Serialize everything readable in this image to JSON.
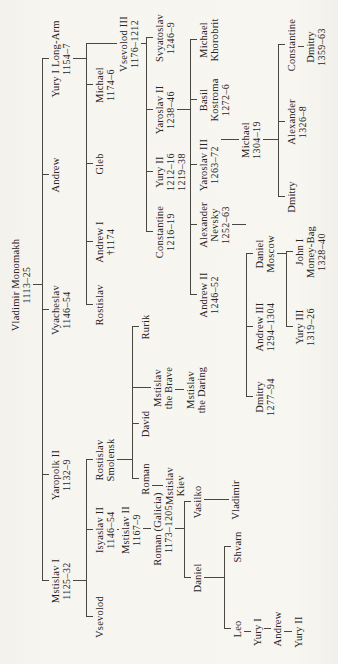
{
  "page": {
    "background": "#f6f4ef",
    "ink": "#26241f",
    "line_color": "#4a4641"
  },
  "tree": {
    "line_height": 11,
    "nodes": [
      {
        "id": "monomakh",
        "name": [
          "Vladimir Monomakh"
        ],
        "dates": [
          "1113–25"
        ],
        "x": 379,
        "y": 10,
        "children": [
          "mstislav1",
          "yaropolk2",
          "vyacheslav",
          "andrew_mono",
          "yury1long"
        ]
      },
      {
        "id": "mstislav1",
        "name": [
          "Mstislav I"
        ],
        "dates": [
          "1125–32"
        ],
        "x": 83,
        "y": 50,
        "children": [
          "vsevolod",
          "isyaslav2",
          "rost_smol"
        ]
      },
      {
        "id": "yaropolk2",
        "name": [
          "Yaropolk II"
        ],
        "dates": [
          "1132–9"
        ],
        "x": 189,
        "y": 50,
        "children": []
      },
      {
        "id": "vyacheslav",
        "name": [
          "Vyacheslav"
        ],
        "dates": [
          "1146–54"
        ],
        "x": 354,
        "y": 50,
        "children": []
      },
      {
        "id": "andrew_mono",
        "name": [
          "Andrew"
        ],
        "dates": [],
        "x": 489,
        "y": 50,
        "children": []
      },
      {
        "id": "yury1long",
        "name": [
          "Yury I Long-Arm"
        ],
        "dates": [
          "1154–7"
        ],
        "x": 605,
        "y": 50,
        "children": [
          "rostislav_y",
          "andrew1",
          "gleb",
          "michael_1174",
          "vsevolod3"
        ]
      },
      {
        "id": "vsevolod",
        "name": [
          "Vsevolod"
        ],
        "dates": [],
        "x": 47,
        "y": 94,
        "children": []
      },
      {
        "id": "isyaslav2",
        "name": [
          "Isyaslav II"
        ],
        "dates": [
          "1146–54"
        ],
        "x": 134,
        "y": 94,
        "children": [
          "mstislav2"
        ]
      },
      {
        "id": "rost_smol",
        "name": [
          "Rostislav",
          "Smolensk"
        ],
        "dates": [],
        "x": 204,
        "y": 94,
        "children": [
          "roman_s",
          "david",
          "mst_brave",
          "rurik"
        ]
      },
      {
        "id": "rostislav_y",
        "name": [
          "Rostislav"
        ],
        "dates": [],
        "x": 359,
        "y": 94,
        "children": []
      },
      {
        "id": "andrew1",
        "name": [
          "Andrew I"
        ],
        "dates": [
          "†1174"
        ],
        "x": 422,
        "y": 94,
        "children": []
      },
      {
        "id": "gleb",
        "name": [
          "Gleb"
        ],
        "dates": [],
        "x": 500,
        "y": 94,
        "children": []
      },
      {
        "id": "michael_1174",
        "name": [
          "Michael"
        ],
        "dates": [
          "1174–6"
        ],
        "x": 579,
        "y": 94,
        "children": []
      },
      {
        "id": "vsevolod3",
        "name": [
          "Vsevolod III"
        ],
        "dates": [
          "1176–1212"
        ],
        "x": 620,
        "y": 118,
        "children": [
          "constantine_1216",
          "yury2",
          "yaroslav2",
          "svyatoslav"
        ]
      },
      {
        "id": "mstislav2",
        "name": [
          "Mstislav II"
        ],
        "dates": [
          "1167–9"
        ],
        "x": 134,
        "y": 120,
        "children": [
          "roman_gal"
        ]
      },
      {
        "id": "roman_gal",
        "name": [
          "Roman (Galicia)"
        ],
        "dates": [
          "1173–1205"
        ],
        "x": 135,
        "y": 152,
        "children": [
          "daniel_gal",
          "vasilko"
        ]
      },
      {
        "id": "roman_s",
        "name": [
          "Roman"
        ],
        "dates": [],
        "x": 185,
        "y": 140,
        "children": [
          "mst_kiev"
        ]
      },
      {
        "id": "david",
        "name": [
          "David"
        ],
        "dates": [],
        "x": 240,
        "y": 140,
        "children": []
      },
      {
        "id": "mst_brave",
        "name": [
          "Mstislav",
          "the Brave"
        ],
        "dates": [],
        "x": 276,
        "y": 152,
        "children": [
          "mst_daring"
        ]
      },
      {
        "id": "rurik",
        "name": [
          "Rurik"
        ],
        "dates": [],
        "x": 337,
        "y": 140,
        "children": []
      },
      {
        "id": "mst_kiev",
        "name": [
          "Mstislav",
          "Kiev"
        ],
        "dates": [],
        "x": 178,
        "y": 164,
        "children": []
      },
      {
        "id": "mst_daring",
        "name": [
          "Mstislav",
          "the Daring"
        ],
        "dates": [],
        "x": 274,
        "y": 185,
        "children": []
      },
      {
        "id": "constantine_1216",
        "name": [
          "Constantine"
        ],
        "dates": [
          "1216–19"
        ],
        "x": 432,
        "y": 154,
        "children": []
      },
      {
        "id": "yury2",
        "name": [
          "Yury II"
        ],
        "dates": [
          "1212–16",
          "1219–38"
        ],
        "x": 492,
        "y": 154,
        "children": []
      },
      {
        "id": "yaroslav2",
        "name": [
          "Yaroslav II"
        ],
        "dates": [
          "1238–46"
        ],
        "x": 554,
        "y": 154,
        "children": [
          "andrew2",
          "nevsky",
          "yaroslav3",
          "basil",
          "mikh_khor"
        ]
      },
      {
        "id": "svyatoslav",
        "name": [
          "Svyatoslav"
        ],
        "dates": [
          "1246–9"
        ],
        "x": 626,
        "y": 154,
        "children": []
      },
      {
        "id": "daniel_gal",
        "name": [
          "Daniel"
        ],
        "dates": [],
        "x": 86,
        "y": 192,
        "children": [
          "leo",
          "shvarn"
        ]
      },
      {
        "id": "vasilko",
        "name": [
          "Vasilko"
        ],
        "dates": [],
        "x": 162,
        "y": 192,
        "children": [
          "vladimir"
        ]
      },
      {
        "id": "vladimir",
        "name": [
          "Vladimir"
        ],
        "dates": [],
        "x": 164,
        "y": 230,
        "children": []
      },
      {
        "id": "shvarn",
        "name": [
          "Shvarn"
        ],
        "dates": [],
        "x": 117,
        "y": 232,
        "children": []
      },
      {
        "id": "leo",
        "name": [
          "Leo"
        ],
        "dates": [],
        "x": 35,
        "y": 232,
        "children": [
          "yury1_gal"
        ]
      },
      {
        "id": "yury1_gal",
        "name": [
          "Yury I"
        ],
        "dates": [],
        "x": 32,
        "y": 252,
        "children": [
          "andrew_gal"
        ]
      },
      {
        "id": "andrew_gal",
        "name": [
          "Andrew"
        ],
        "dates": [],
        "x": 35,
        "y": 272,
        "children": [
          "yury2_gal"
        ]
      },
      {
        "id": "yury2_gal",
        "name": [
          "Yury II"
        ],
        "dates": [],
        "x": 32,
        "y": 293,
        "children": []
      },
      {
        "id": "andrew2",
        "name": [
          "Andrew II"
        ],
        "dates": [
          "1246–52"
        ],
        "x": 369,
        "y": 198,
        "children": []
      },
      {
        "id": "nevsky",
        "name": [
          "Alexander",
          "Nevsky"
        ],
        "dates": [
          "1252–63"
        ],
        "x": 439,
        "y": 198,
        "children": [
          "dmitry_1277",
          "andrew3",
          "daniel_mosc"
        ]
      },
      {
        "id": "yaroslav3",
        "name": [
          "Yaroslav III"
        ],
        "dates": [
          "1263–72"
        ],
        "x": 499,
        "y": 198,
        "children": [
          "michael_1304"
        ]
      },
      {
        "id": "basil",
        "name": [
          "Basil",
          "Kostroma"
        ],
        "dates": [
          "1272–6"
        ],
        "x": 564,
        "y": 198,
        "children": []
      },
      {
        "id": "mikh_khor",
        "name": [
          "Michael",
          "Khorobrit"
        ],
        "dates": [],
        "x": 624,
        "y": 198,
        "children": []
      },
      {
        "id": "michael_1304",
        "name": [
          "Michael"
        ],
        "dates": [
          "1304–19"
        ],
        "x": 524,
        "y": 240,
        "children": [
          "dmitry_tver",
          "alexander_1326",
          "constantine_tver"
        ]
      },
      {
        "id": "dmitry_1277",
        "name": [
          "Dmitry"
        ],
        "dates": [
          "1277–94"
        ],
        "x": 267,
        "y": 254,
        "children": []
      },
      {
        "id": "andrew3",
        "name": [
          "Andrew III"
        ],
        "dates": [
          "1294–1304"
        ],
        "x": 337,
        "y": 254,
        "children": []
      },
      {
        "id": "daniel_mosc",
        "name": [
          "Daniel",
          "Moscow"
        ],
        "dates": [],
        "x": 410,
        "y": 254,
        "children": [
          "yury3",
          "john1"
        ]
      },
      {
        "id": "yury3",
        "name": [
          "Yury III"
        ],
        "dates": [
          "1319–26"
        ],
        "x": 337,
        "y": 294,
        "children": []
      },
      {
        "id": "john1",
        "name": [
          "John I",
          "Money-Bag"
        ],
        "dates": [
          "1328–40"
        ],
        "x": 412,
        "y": 294,
        "children": []
      },
      {
        "id": "dmitry_tver",
        "name": [
          "Dmitry"
        ],
        "dates": [],
        "x": 467,
        "y": 286,
        "children": []
      },
      {
        "id": "alexander_1326",
        "name": [
          "Alexander"
        ],
        "dates": [
          "1326–8"
        ],
        "x": 542,
        "y": 286,
        "children": []
      },
      {
        "id": "constantine_tver",
        "name": [
          "Constantine"
        ],
        "dates": [],
        "x": 619,
        "y": 286,
        "children": [
          "dmitry_1359"
        ]
      },
      {
        "id": "dmitry_1359",
        "name": [
          "Dmitry"
        ],
        "dates": [
          "1359–63"
        ],
        "x": 617,
        "y": 305,
        "children": []
      }
    ]
  }
}
